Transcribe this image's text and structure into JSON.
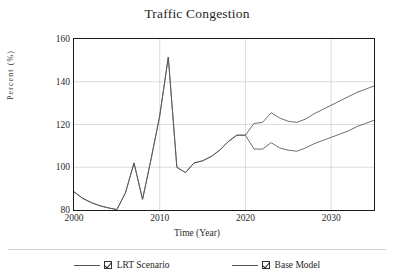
{
  "chart_data": {
    "type": "line",
    "title": "Traffic Congestion",
    "xlabel": "Time (Year)",
    "ylabel": "Percent (%)",
    "xlim": [
      2000,
      2035
    ],
    "ylim": [
      80,
      160
    ],
    "yticks": [
      80,
      100,
      120,
      140,
      160
    ],
    "xticks": [
      2000,
      2010,
      2020,
      2030
    ],
    "grid": true,
    "legend_position": "bottom",
    "x": [
      2000,
      2001,
      2002,
      2003,
      2004,
      2005,
      2006,
      2007,
      2008,
      2009,
      2010,
      2011,
      2012,
      2013,
      2014,
      2015,
      2016,
      2017,
      2018,
      2019,
      2020,
      2021,
      2022,
      2023,
      2024,
      2025,
      2026,
      2027,
      2028,
      2029,
      2030,
      2031,
      2032,
      2033,
      2034,
      2035
    ],
    "series": [
      {
        "name": "Base Model",
        "values": [
          88.5,
          85.5,
          83.5,
          82.0,
          81.0,
          80.2,
          88.0,
          102.0,
          85.0,
          104.0,
          124.0,
          151.5,
          100.0,
          97.5,
          102.0,
          103.0,
          105.0,
          108.0,
          112.0,
          115.0,
          115.0,
          120.5,
          121.0,
          125.5,
          123.0,
          121.5,
          121.0,
          122.5,
          125.0,
          127.0,
          129.0,
          131.0,
          133.0,
          135.0,
          136.5,
          138.0
        ]
      },
      {
        "name": "LRT Scenario",
        "values": [
          88.5,
          85.5,
          83.5,
          82.0,
          81.0,
          80.2,
          88.0,
          102.0,
          85.0,
          104.0,
          124.0,
          151.5,
          100.0,
          97.5,
          102.0,
          103.0,
          105.0,
          108.0,
          112.0,
          115.0,
          115.0,
          108.5,
          108.5,
          111.5,
          109.0,
          108.0,
          107.5,
          109.0,
          111.0,
          112.5,
          114.0,
          115.5,
          117.0,
          119.0,
          120.5,
          122.0
        ]
      }
    ]
  },
  "legend": {
    "items": [
      {
        "label": "LRT Scenario",
        "checked": true,
        "color": "#555555"
      },
      {
        "label": "Base Model",
        "checked": true,
        "color": "#555555"
      }
    ]
  },
  "colors": {
    "line": "#555555",
    "axis": "#1a1a1a",
    "grid": "#cccccc",
    "background": "#ffffff"
  }
}
